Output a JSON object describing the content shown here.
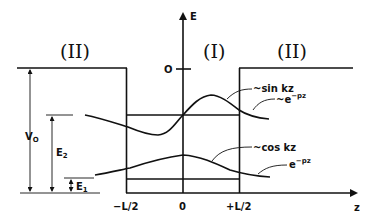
{
  "diagram": {
    "type": "finite-square-well-energy-diagram",
    "regions": {
      "left": "(II)",
      "center": "(I)",
      "right": "(II)"
    },
    "axes": {
      "vertical_label": "E",
      "horizontal_label": "z",
      "zero_label": "O",
      "ticks": {
        "left": "−L/2",
        "center": "0",
        "right": "+L/2"
      }
    },
    "levels": {
      "well_depth": {
        "label": "V",
        "subscript": "O"
      },
      "e2": {
        "label": "E",
        "subscript": "2"
      },
      "e1": {
        "label": "E",
        "subscript": "1"
      }
    },
    "annotations": {
      "sin": "~sin kz",
      "exp_upper_prefix": "~e",
      "exp_upper_sup": "−pz",
      "cos": "~cos kz",
      "exp_lower_prefix": "e",
      "exp_lower_sup": "−pz"
    },
    "colors": {
      "ink": "#111111",
      "background": "#ffffff"
    }
  }
}
